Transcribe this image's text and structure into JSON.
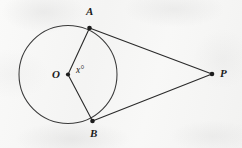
{
  "figure": {
    "kind": "geometry-diagram",
    "background_color": "#f7f7f6",
    "ink_color": "#2a2a2a"
  },
  "labels": {
    "point_a": "A",
    "point_b": "B",
    "center_o": "O",
    "point_p": "P",
    "angle_x": "x°"
  },
  "geometry": {
    "circle": {
      "cx": 68,
      "cy": 74.5,
      "r": 49
    },
    "points": {
      "A": {
        "x": 89.5,
        "y": 28
      },
      "B": {
        "x": 92.5,
        "y": 121
      },
      "O": {
        "x": 68,
        "y": 74.5
      },
      "P": {
        "x": 212,
        "y": 74
      }
    },
    "segments": [
      {
        "name": "radius-OA",
        "from": "O",
        "to": "A"
      },
      {
        "name": "radius-OB",
        "from": "O",
        "to": "B"
      },
      {
        "name": "tangent-AP",
        "from": "A",
        "to": "P"
      },
      {
        "name": "tangent-BP",
        "from": "B",
        "to": "P"
      }
    ],
    "dots": [
      "O",
      "A",
      "B",
      "P"
    ]
  }
}
